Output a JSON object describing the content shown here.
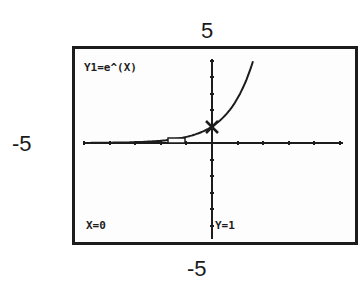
{
  "window_labels": {
    "ymax": "5",
    "xmin": "-5",
    "ymin": "-5"
  },
  "screen": {
    "function_label": "Y1=e^(X)",
    "trace_x_label": "X=0",
    "trace_y_label": "Y=1"
  },
  "chart_data": {
    "type": "line",
    "title": "Y1=e^(X)",
    "xlabel": "",
    "ylabel": "",
    "xlim": [
      -5,
      5
    ],
    "ylim": [
      -5,
      5
    ],
    "grid": false,
    "tick_spacing": 1,
    "series": [
      {
        "name": "Y1=e^(X)",
        "x": [
          -4,
          -3,
          -2,
          -1,
          0,
          0.5,
          1,
          1.5,
          1.609
        ],
        "values": [
          0.018,
          0.05,
          0.135,
          0.368,
          1,
          1.649,
          2.718,
          4.482,
          5
        ]
      }
    ],
    "trace_cursor": {
      "x": 0,
      "y": 1
    },
    "annotations": [
      "5",
      "-5",
      "-5",
      "X=0",
      "Y=1"
    ]
  }
}
